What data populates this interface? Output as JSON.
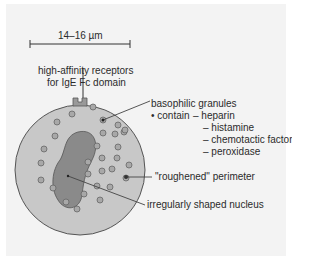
{
  "diagram": {
    "title": "Basophil",
    "scale_label": "14–16 µm",
    "labels": {
      "receptors_line1": "high-affinity receptors",
      "receptors_line2": "for IgE Fc domain",
      "granules": "basophilic granules",
      "contain": "• contain",
      "contents": [
        "– heparin",
        "– histamine",
        "– chemotactic factors",
        "– peroxidase"
      ],
      "perimeter": "\"roughened\" perimeter",
      "nucleus": "irregularly shaped nucleus"
    },
    "colors": {
      "background": "#f3f3f3",
      "cytoplasm": "#c8c8c8",
      "nucleus": "#8a8a8a",
      "granule": "#a8a8a8",
      "outline": "#555555"
    }
  }
}
